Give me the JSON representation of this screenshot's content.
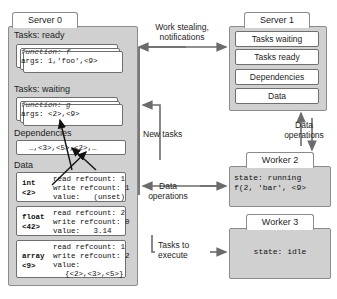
{
  "server0": {
    "tab_label": "Server 0",
    "sections": {
      "tasks_ready_label": "Tasks: ready",
      "tasks_waiting_label": "Tasks: waiting",
      "dependencies_label": "Dependencies",
      "data_label": "Data"
    },
    "ready_task": {
      "line1": "function: f",
      "line2": "args: 1,'foo',<9>"
    },
    "waiting_task": {
      "line1": "function: g",
      "line2": "args: <2>,<9>"
    },
    "dependencies_value": "…,<3>,<5>,<2>,…",
    "data_records": [
      {
        "type": "int",
        "handle": "<2>",
        "read_refcount_label": "read refcount:",
        "read_refcount": "1",
        "write_refcount_label": "write refcount:",
        "write_refcount": "1",
        "value_label": "value:",
        "value": "(unset)",
        "value_extra": ""
      },
      {
        "type": "float",
        "handle": "<42>",
        "read_refcount_label": "read refcount:",
        "read_refcount": "2",
        "write_refcount_label": "write refcount:",
        "write_refcount": "0",
        "value_label": "value:",
        "value": "3.14",
        "value_extra": ""
      },
      {
        "type": "array",
        "handle": "<9>",
        "read_refcount_label": "read refcount:",
        "read_refcount": "1",
        "write_refcount_label": "write refcount:",
        "write_refcount": "2",
        "value_label": "value:",
        "value": "",
        "value_extra": "{<2>,<3>,<5>}"
      }
    ]
  },
  "server1": {
    "tab_label": "Server 1",
    "rows": [
      {
        "label": "Tasks waiting"
      },
      {
        "label": "Tasks ready"
      },
      {
        "label": "Dependencies"
      },
      {
        "label": "Data"
      }
    ]
  },
  "worker2": {
    "tab_label": "Worker 2",
    "line1": "state: running",
    "line2": "f(2, 'bar', <9>"
  },
  "worker3": {
    "tab_label": "Worker 3",
    "line1": "state: idle"
  },
  "connectors": {
    "work_stealing": "Work stealing,\nnotifications",
    "work_stealing_l1": "Work stealing,",
    "work_stealing_l2": "notifications",
    "new_tasks": "New tasks",
    "data_operations_left_l1": "Data",
    "data_operations_left_l2": "operations",
    "data_operations_right_l1": "Data",
    "data_operations_right_l2": "operations",
    "tasks_to_execute_l1": "Tasks to",
    "tasks_to_execute_l2": "execute"
  },
  "colors": {
    "panel_fill": "#d0d0d0",
    "card_fill": "#ffffff",
    "stroke": "#6f6f6f",
    "text": "#1d1d1d",
    "arrow": "#6b6b6b"
  }
}
